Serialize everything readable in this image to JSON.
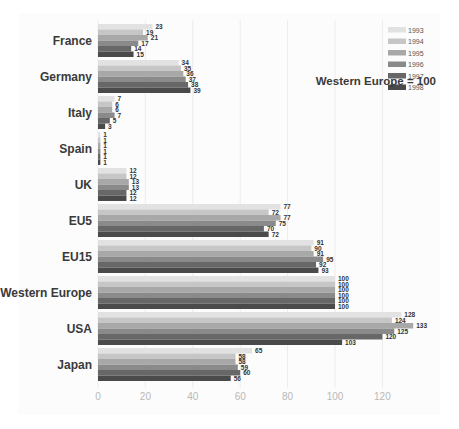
{
  "chart_data": {
    "type": "bar",
    "orientation": "horizontal",
    "title": "",
    "xlabel": "",
    "ylabel": "",
    "xlim": [
      0,
      140
    ],
    "xticks": [
      0,
      20,
      40,
      60,
      80,
      100,
      120
    ],
    "grid": true,
    "legend_position": "top-right",
    "annotation": "Western Europe = 100",
    "categories": [
      "France",
      "Germany",
      "Italy",
      "Spain",
      "UK",
      "EU5",
      "EU15",
      "Western Europe",
      "USA",
      "Japan"
    ],
    "series": [
      {
        "name": "1993",
        "color": "#e2e2e2",
        "values": [
          23,
          34,
          7,
          1,
          12,
          77,
          91,
          100,
          128,
          65
        ]
      },
      {
        "name": "1994",
        "color": "#c6c6c6",
        "values": [
          19,
          35,
          6,
          1,
          12,
          72,
          90,
          100,
          124,
          58
        ]
      },
      {
        "name": "1995",
        "color": "#a8a8a8",
        "values": [
          21,
          36,
          6,
          1,
          13,
          77,
          91,
          100,
          133,
          58
        ]
      },
      {
        "name": "1996",
        "color": "#8a8a8a",
        "values": [
          17,
          37,
          7,
          1,
          13,
          75,
          95,
          100,
          125,
          59
        ]
      },
      {
        "name": "1997",
        "color": "#676767",
        "values": [
          14,
          38,
          5,
          1,
          12,
          70,
          92,
          100,
          120,
          60
        ]
      },
      {
        "name": "1998",
        "color": "#4a4a4a",
        "values": [
          15,
          39,
          3,
          1,
          12,
          72,
          93,
          100,
          103,
          56
        ]
      }
    ]
  }
}
